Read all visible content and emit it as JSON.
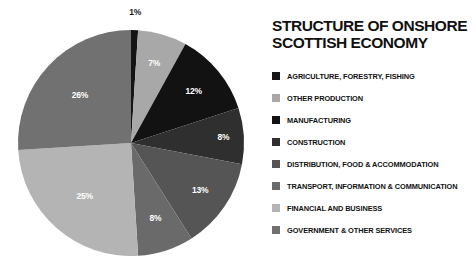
{
  "title": "STRUCTURE OF ONSHORE\nSCOTTISH ECONOMY",
  "chart_data": {
    "type": "pie",
    "title": "STRUCTURE OF ONSHORE SCOTTISH ECONOMY",
    "xlabel": "",
    "ylabel": "",
    "units": "percent",
    "legend_position": "right",
    "grid": false,
    "start_angle_deg": 0,
    "direction": "clockwise",
    "categories": [
      "AGRICULTURE, FORESTRY, FISHING",
      "OTHER PRODUCTION",
      "MANUFACTURING",
      "CONSTRUCTION",
      "DISTRIBUTION, FOOD & ACCOMMODATION",
      "TRANSPORT, INFORMATION & COMMUNICATION",
      "FINANCIAL AND BUSINESS",
      "GOVERNMENT & OTHER SERVICES"
    ],
    "values": [
      1,
      7,
      12,
      8,
      13,
      8,
      25,
      26
    ],
    "labels": [
      "1%",
      "7%",
      "12%",
      "8%",
      "13%",
      "8%",
      "25%",
      "26%"
    ],
    "colors": [
      "#151515",
      "#a8a8a8",
      "#121212",
      "#2f2f2f",
      "#555555",
      "#6a6a6a",
      "#b4b4b4",
      "#717171"
    ],
    "slices": [
      {
        "label": "1%",
        "value": 1,
        "category": "AGRICULTURE, FORESTRY, FISHING",
        "color": "#151515"
      },
      {
        "label": "7%",
        "value": 7,
        "category": "OTHER PRODUCTION",
        "color": "#a8a8a8"
      },
      {
        "label": "12%",
        "value": 12,
        "category": "MANUFACTURING",
        "color": "#121212"
      },
      {
        "label": "8%",
        "value": 8,
        "category": "CONSTRUCTION",
        "color": "#2f2f2f"
      },
      {
        "label": "13%",
        "value": 13,
        "category": "DISTRIBUTION, FOOD & ACCOMMODATION",
        "color": "#555555"
      },
      {
        "label": "8%",
        "value": 8,
        "category": "TRANSPORT, INFORMATION & COMMUNICATION",
        "color": "#6a6a6a"
      },
      {
        "label": "25%",
        "value": 25,
        "category": "FINANCIAL AND BUSINESS",
        "color": "#b4b4b4"
      },
      {
        "label": "26%",
        "value": 26,
        "category": "GOVERNMENT & OTHER SERVICES",
        "color": "#717171"
      }
    ]
  },
  "legend": {
    "items": [
      {
        "label": "AGRICULTURE, FORESTRY, FISHING",
        "color": "#151515"
      },
      {
        "label": "OTHER PRODUCTION",
        "color": "#a8a8a8"
      },
      {
        "label": "MANUFACTURING",
        "color": "#121212"
      },
      {
        "label": "CONSTRUCTION",
        "color": "#2f2f2f"
      },
      {
        "label": "DISTRIBUTION, FOOD & ACCOMMODATION",
        "color": "#555555"
      },
      {
        "label": "TRANSPORT, INFORMATION & COMMUNICATION",
        "color": "#6a6a6a"
      },
      {
        "label": "FINANCIAL AND BUSINESS",
        "color": "#b4b4b4"
      },
      {
        "label": "GOVERNMENT & OTHER SERVICES",
        "color": "#717171"
      }
    ]
  }
}
